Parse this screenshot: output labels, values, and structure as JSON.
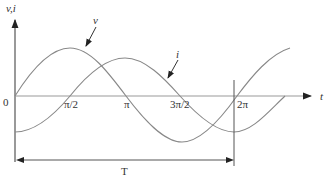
{
  "diagram": {
    "y_axis_label": "v,i",
    "x_axis_label": "t",
    "origin_label": "0",
    "x_ticks": [
      "π/2",
      "π",
      "3π/2",
      "2π"
    ],
    "curves": [
      {
        "name": "v",
        "label": "v",
        "description": "voltage sinusoid, starts at zero"
      },
      {
        "name": "i",
        "label": "i",
        "description": "current sinusoid, lags voltage by π/2"
      }
    ],
    "period_label": "T",
    "colors": {
      "curve": "#888888",
      "axis": "#555555",
      "text": "#333333"
    }
  }
}
